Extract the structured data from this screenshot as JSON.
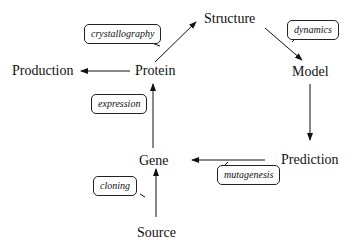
{
  "diagram": {
    "nodes": [
      {
        "id": "structure",
        "label": "Structure"
      },
      {
        "id": "model",
        "label": "Model"
      },
      {
        "id": "prediction",
        "label": "Prediction"
      },
      {
        "id": "gene",
        "label": "Gene"
      },
      {
        "id": "source",
        "label": "Source"
      },
      {
        "id": "protein",
        "label": "Protein"
      },
      {
        "id": "production",
        "label": "Production"
      }
    ],
    "edges": [
      {
        "from": "protein",
        "to": "structure",
        "label": "crystallography"
      },
      {
        "from": "structure",
        "to": "model",
        "label": "dynamics"
      },
      {
        "from": "model",
        "to": "prediction",
        "label": ""
      },
      {
        "from": "prediction",
        "to": "gene",
        "label": "mutagenesis"
      },
      {
        "from": "source",
        "to": "gene",
        "label": "cloning"
      },
      {
        "from": "gene",
        "to": "protein",
        "label": "expression"
      },
      {
        "from": "protein",
        "to": "production",
        "label": ""
      }
    ]
  }
}
